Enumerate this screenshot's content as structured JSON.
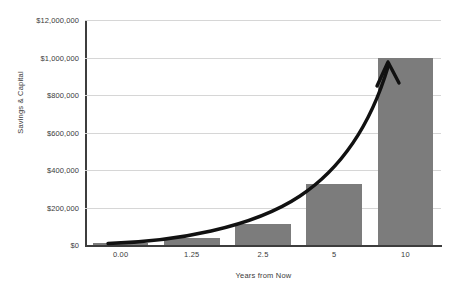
{
  "chart_data": {
    "type": "bar",
    "title": "",
    "subtitle": "",
    "xlabel": "Years from Now",
    "ylabel": "Savings & Capital",
    "categories": [
      "0.00",
      "1.25",
      "2.5",
      "5",
      "10"
    ],
    "values": [
      10000,
      35000,
      110000,
      325000,
      1000000
    ],
    "series": [
      {
        "name": "Savings & Capital",
        "values": [
          10000,
          35000,
          110000,
          325000,
          1000000
        ]
      }
    ],
    "ylim": [
      0,
      1200000
    ],
    "y_ticks": [
      0,
      200000,
      400000,
      600000,
      800000,
      1000000,
      1200000
    ],
    "y_tick_labels": [
      "$0",
      "$200,000",
      "$400,000",
      "$600,000",
      "$800,000",
      "$1,000,000",
      "$12,000,000"
    ],
    "x_tick_labels": [
      "0.00",
      "1.25",
      "2.5",
      "5",
      "10"
    ],
    "grid": "horizontal",
    "legend": "none",
    "annotations": [
      {
        "name": "exponential-growth-arrow",
        "description": "Thick black curved arrow tracing exponential growth from the left baseline up to the top of the final bar"
      }
    ],
    "colors": {
      "bar_fill": "#7c7c7c",
      "gridline": "#d6d6d6",
      "axis": "#3d3d3d",
      "text": "#3a3a3a",
      "arrow": "#000000",
      "background": "#ffffff"
    }
  }
}
